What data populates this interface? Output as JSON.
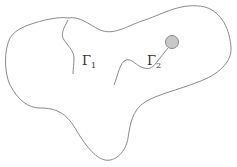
{
  "diagram": {
    "type": "domain-with-curves",
    "colors": {
      "stroke": "#8a8a8a",
      "circle_fill": "#c8c8c8",
      "circle_stroke": "#8a8a8a",
      "background": "#ffffff",
      "label": "#333333"
    },
    "labels": [
      {
        "id": "gamma1",
        "base": "Γ",
        "sub": "1"
      },
      {
        "id": "gamma2",
        "base": "Γ",
        "sub": "2"
      }
    ],
    "elements": [
      {
        "name": "outer-boundary",
        "kind": "closed-curve"
      },
      {
        "name": "curve-gamma-1",
        "kind": "open-curve"
      },
      {
        "name": "curve-gamma-2",
        "kind": "open-curve-ending-at-disk"
      },
      {
        "name": "small-disk",
        "kind": "circle"
      }
    ]
  }
}
